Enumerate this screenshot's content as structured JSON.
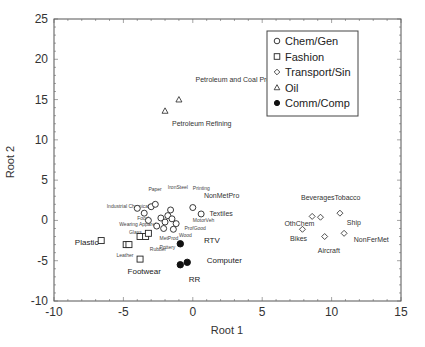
{
  "chart_data": {
    "type": "scatter",
    "title": "",
    "xlabel": "Root 1",
    "ylabel": "Root 2",
    "xlim": [
      -10,
      15
    ],
    "ylim": [
      -10,
      25
    ],
    "xticks": [
      "-10",
      "-5",
      "0",
      "5",
      "10",
      "15"
    ],
    "yticks": [
      "25",
      "20",
      "15",
      "10",
      "5",
      "0",
      "-5",
      "-10"
    ],
    "grid": false,
    "legend_position": "upper right",
    "legend": [
      {
        "name": "Chem/Gen",
        "marker": "open-circle"
      },
      {
        "name": "Fashion",
        "marker": "open-square"
      },
      {
        "name": "Transport/Sin",
        "marker": "open-diamond"
      },
      {
        "name": "Oil",
        "marker": "open-triangle"
      },
      {
        "name": "Comm/Comp",
        "marker": "filled-circle"
      }
    ],
    "series": [
      {
        "name": "Chem/Gen",
        "marker": "open-circle",
        "points": [
          {
            "x": -4.0,
            "y": 1.5
          },
          {
            "x": -3.5,
            "y": 0.9
          },
          {
            "x": -3.0,
            "y": 1.7
          },
          {
            "x": -2.7,
            "y": 2.0
          },
          {
            "x": -3.2,
            "y": 0.0
          },
          {
            "x": -2.6,
            "y": -0.7
          },
          {
            "x": -2.3,
            "y": 0.3
          },
          {
            "x": -2.0,
            "y": -0.2
          },
          {
            "x": -1.8,
            "y": 0.6
          },
          {
            "x": -1.6,
            "y": 1.3
          },
          {
            "x": -1.5,
            "y": 0.2
          },
          {
            "x": -1.2,
            "y": -0.4
          },
          {
            "x": -1.4,
            "y": -1.1
          },
          {
            "x": -2.1,
            "y": -1.0
          },
          {
            "x": 0.0,
            "y": 1.6
          },
          {
            "x": 0.6,
            "y": 0.8
          }
        ],
        "labels": [
          "Industrial Chemicals",
          "Paper",
          "IronSteel",
          "Printing",
          "NonMetPro",
          "Textiles",
          "Food",
          "MotorVeh",
          "ProfGood",
          "Wood",
          "MetProd",
          "Pottery"
        ]
      },
      {
        "name": "Fashion",
        "marker": "open-square",
        "points": [
          {
            "x": -6.6,
            "y": -2.5
          },
          {
            "x": -4.8,
            "y": -3.0
          },
          {
            "x": -4.6,
            "y": -3.0
          },
          {
            "x": -3.8,
            "y": -2.0
          },
          {
            "x": -3.4,
            "y": -2.0
          },
          {
            "x": -3.2,
            "y": -1.6
          },
          {
            "x": -3.8,
            "y": -4.8
          }
        ],
        "labels": [
          "Plastic",
          "Glass",
          "Wearing Apparel",
          "Rubber",
          "Leather",
          "Footwear"
        ]
      },
      {
        "name": "Transport/Sin",
        "marker": "open-diamond",
        "points": [
          {
            "x": 8.6,
            "y": 0.5
          },
          {
            "x": 9.2,
            "y": 0.4
          },
          {
            "x": 10.6,
            "y": 0.9
          },
          {
            "x": 7.9,
            "y": -1.1
          },
          {
            "x": 9.5,
            "y": -2.0
          },
          {
            "x": 10.9,
            "y": -1.6
          }
        ],
        "labels": [
          "Beverages",
          "Tobacco",
          "OthChem",
          "Ship",
          "Bikes",
          "NonFerMet",
          "Aircraft"
        ]
      },
      {
        "name": "Oil",
        "marker": "open-triangle",
        "points": [
          {
            "x": -1.0,
            "y": 15.0
          },
          {
            "x": -2.0,
            "y": 13.6
          }
        ],
        "labels": [
          "Petroleum and Coal Products",
          "Petroleum Refining"
        ]
      },
      {
        "name": "Comm/Comp",
        "marker": "filled-circle",
        "points": [
          {
            "x": -0.9,
            "y": -2.9
          },
          {
            "x": -0.4,
            "y": -5.2
          },
          {
            "x": -0.9,
            "y": -5.5
          }
        ],
        "labels": [
          "RTV",
          "Computer",
          "RR"
        ]
      }
    ],
    "annotations": [
      {
        "text": "Petroleum and Coal Products",
        "x": 0.2,
        "y": 17.2
      },
      {
        "text": "Petroleum Refining",
        "x": -1.5,
        "y": 11.7
      },
      {
        "text": "Paper",
        "x": -3.2,
        "y": 3.6
      },
      {
        "text": "IronSteel",
        "x": -1.8,
        "y": 3.9
      },
      {
        "text": "Printing",
        "x": 0.0,
        "y": 3.8
      },
      {
        "text": "NonMetPro",
        "x": 0.8,
        "y": 2.8
      },
      {
        "text": "Textiles",
        "x": 1.2,
        "y": 0.6
      },
      {
        "text": "Industrial Chemicals",
        "x": -6.2,
        "y": 1.5
      },
      {
        "text": "Food",
        "x": -4.0,
        "y": 0.0
      },
      {
        "text": "Wearing Apparel",
        "x": -5.3,
        "y": -0.7
      },
      {
        "text": "Glass",
        "x": -4.6,
        "y": -1.7
      },
      {
        "text": "MotorVeh",
        "x": 0.0,
        "y": -0.2
      },
      {
        "text": "ProfGood",
        "x": -0.6,
        "y": -1.2
      },
      {
        "text": "Wood",
        "x": -1.0,
        "y": -2.0
      },
      {
        "text": "MetProd",
        "x": -2.4,
        "y": -2.4
      },
      {
        "text": "Pottery",
        "x": -2.4,
        "y": -3.6
      },
      {
        "text": "Rubber",
        "x": -3.1,
        "y": -3.8
      },
      {
        "text": "Leather",
        "x": -5.5,
        "y": -4.5
      },
      {
        "text": "Footwear",
        "x": -4.7,
        "y": -6.7
      },
      {
        "text": "Plastic",
        "x": -8.5,
        "y": -3.0
      },
      {
        "text": "RTV",
        "x": 0.8,
        "y": -2.8
      },
      {
        "text": "Computer",
        "x": 1.0,
        "y": -5.3
      },
      {
        "text": "RR",
        "x": -0.3,
        "y": -7.7
      },
      {
        "text": "Beverages",
        "x": 7.8,
        "y": 2.5
      },
      {
        "text": "Tobacco",
        "x": 10.2,
        "y": 2.5
      },
      {
        "text": "OthChem",
        "x": 6.6,
        "y": -0.7
      },
      {
        "text": "Ship",
        "x": 11.1,
        "y": -0.6
      },
      {
        "text": "Bikes",
        "x": 7.0,
        "y": -2.5
      },
      {
        "text": "NonFerMet",
        "x": 11.6,
        "y": -2.7
      },
      {
        "text": "Aircraft",
        "x": 9.0,
        "y": -4.1
      }
    ]
  }
}
